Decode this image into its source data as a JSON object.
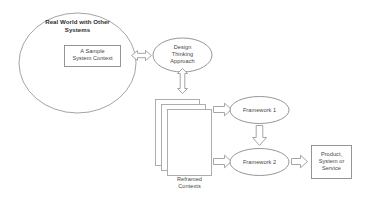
{
  "diagram": {
    "background_color": "#ffffff",
    "stroke_color": "#8a8a8a",
    "text_color": "#454545",
    "nodes": {
      "real_world_circle": {
        "label": "Real World with Other\nSystems",
        "shape": "circle"
      },
      "system_context_box": {
        "label": "A Sample\nSystem Context",
        "shape": "rectangle"
      },
      "design_thinking_ellipse": {
        "label": "Design\nThinking\nApproach",
        "shape": "ellipse"
      },
      "reframed_contexts_stack": {
        "label": "Reframed\nContexts",
        "shape": "stacked-rectangles",
        "layers": 3
      },
      "framework_one_ellipse": {
        "label": "Framework 1",
        "shape": "ellipse"
      },
      "framework_two_ellipse": {
        "label": "Framework 2",
        "shape": "ellipse"
      },
      "product_output_box": {
        "label": "Product,\nSystem or\nService",
        "shape": "rectangle"
      }
    },
    "connectors": [
      {
        "name": "context-to-design-thinking-arrow",
        "icon": "double-arrow-horizontal-icon",
        "direction": "bidirectional-horizontal"
      },
      {
        "name": "design-thinking-to-contexts-arrow",
        "icon": "double-arrow-vertical-icon",
        "direction": "bidirectional-vertical"
      },
      {
        "name": "contexts-to-framework-one-arrow",
        "icon": "arrow-right-icon",
        "direction": "right"
      },
      {
        "name": "contexts-to-framework-two-arrow",
        "icon": "arrow-right-icon",
        "direction": "right"
      },
      {
        "name": "framework-one-to-framework-two-arrow",
        "icon": "arrow-down-icon",
        "direction": "down"
      },
      {
        "name": "framework-two-to-product-arrow",
        "icon": "arrow-right-icon",
        "direction": "right"
      }
    ]
  }
}
